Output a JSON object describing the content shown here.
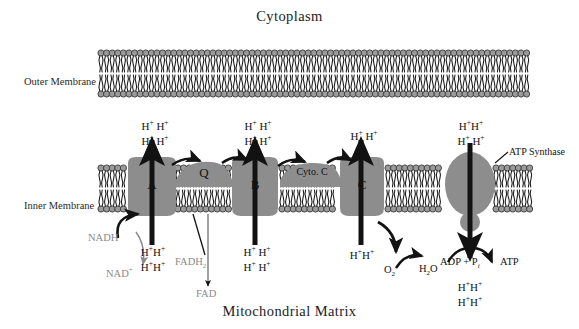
{
  "diagram": {
    "title_top": "Cytoplasm",
    "title_bottom": "Mitochondrial Matrix",
    "membrane_labels": {
      "outer": "Outer Membrane",
      "inner": "Inner Membrane"
    },
    "complexes": [
      {
        "id": "A",
        "label": "A"
      },
      {
        "id": "Q",
        "label": "Q"
      },
      {
        "id": "B",
        "label": "B"
      },
      {
        "id": "cytc",
        "label": "Cyto. C"
      },
      {
        "id": "C",
        "label": "C"
      }
    ],
    "atp_synthase_label": "ATP Synthase",
    "proton_clusters": [
      {
        "id": "above-A",
        "text": "H+ H+ / H+ H+"
      },
      {
        "id": "above-B",
        "text": "H+ H+ / H+ H+"
      },
      {
        "id": "above-C",
        "text": "H+ H+"
      },
      {
        "id": "above-atp-synthase",
        "text": "H+ H+ / H+ H+"
      },
      {
        "id": "below-A",
        "text": "H+ H+ / H+ H+"
      },
      {
        "id": "below-B",
        "text": "H+ H+ / H+ H+"
      },
      {
        "id": "below-C",
        "text": "H+ H+"
      },
      {
        "id": "below-atp-synthase",
        "text": "H+ H+ / H+ H+"
      }
    ],
    "proton": {
      "symbol": "H",
      "charge": "+"
    },
    "molecules": {
      "nadh": "NADH",
      "nad_plus": "NAD",
      "nad_plus_charge": "+",
      "fadh2": "FADH",
      "fadh2_sub": "2",
      "fad": "FAD",
      "o2": "O",
      "o2_sub": "2",
      "h2o_h": "H",
      "h2o_sub": "2",
      "h2o_o": "O",
      "adp_pi": "ADP + P",
      "adp_pi_sub": "i",
      "atp": "ATP"
    },
    "colors": {
      "complex_fill": "#8d8d8d",
      "membrane_head": "#8c8c8c",
      "gray_text": "#8a8a8a",
      "black_text": "#141414",
      "background": "#ffffff"
    }
  }
}
